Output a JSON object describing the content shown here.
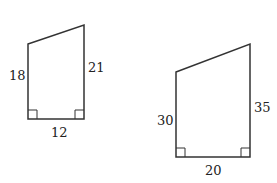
{
  "figure": {
    "shapes": [
      {
        "name": "small-trapezoid",
        "left_side": "18",
        "right_side": "21",
        "bottom": "12",
        "right_angles": 2
      },
      {
        "name": "large-trapezoid",
        "left_side": "30",
        "right_side": "35",
        "bottom": "20",
        "right_angles": 2
      }
    ],
    "stroke_color": "#333333"
  }
}
